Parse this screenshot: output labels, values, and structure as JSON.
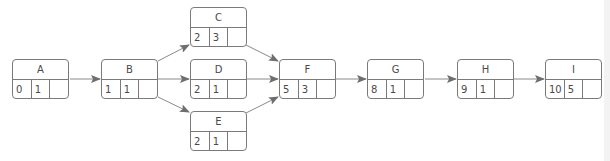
{
  "diagram": {
    "type": "activity-on-node network",
    "colors": {
      "line": "#7a7a7a",
      "arrow": "#6e6e6e",
      "text": "#4a4a4a"
    },
    "nodes": [
      {
        "id": "A",
        "label": "A",
        "v1": "0",
        "v2": "1",
        "v3": ""
      },
      {
        "id": "B",
        "label": "B",
        "v1": "1",
        "v2": "1",
        "v3": ""
      },
      {
        "id": "C",
        "label": "C",
        "v1": "2",
        "v2": "3",
        "v3": ""
      },
      {
        "id": "D",
        "label": "D",
        "v1": "2",
        "v2": "1",
        "v3": ""
      },
      {
        "id": "E",
        "label": "E",
        "v1": "2",
        "v2": "1",
        "v3": ""
      },
      {
        "id": "F",
        "label": "F",
        "v1": "5",
        "v2": "3",
        "v3": ""
      },
      {
        "id": "G",
        "label": "G",
        "v1": "8",
        "v2": "1",
        "v3": ""
      },
      {
        "id": "H",
        "label": "H",
        "v1": "9",
        "v2": "1",
        "v3": ""
      },
      {
        "id": "I",
        "label": "I",
        "v1": "10",
        "v2": "5",
        "v3": ""
      }
    ],
    "edges": [
      [
        "A",
        "B"
      ],
      [
        "B",
        "C"
      ],
      [
        "B",
        "D"
      ],
      [
        "B",
        "E"
      ],
      [
        "C",
        "F"
      ],
      [
        "D",
        "F"
      ],
      [
        "E",
        "F"
      ],
      [
        "F",
        "G"
      ],
      [
        "G",
        "H"
      ],
      [
        "H",
        "I"
      ]
    ]
  }
}
